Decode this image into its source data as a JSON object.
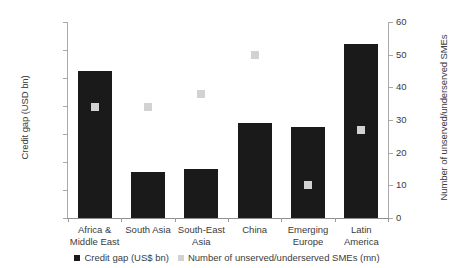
{
  "chart_data": {
    "type": "bar",
    "title": "",
    "xlabel": "",
    "ylabel": "Credit gap (USD bn)",
    "y2label": "Number of unserved/underserved SMEs",
    "categories": [
      "Africa &\nMiddle East",
      "South Asia",
      "South-East\nAsia",
      "China",
      "Emerging\nEurope",
      "Latin\nAmerica"
    ],
    "category_lines": [
      [
        "Africa &",
        "Middle East"
      ],
      [
        "South Asia",
        ""
      ],
      [
        "South-East",
        "Asia"
      ],
      [
        "China",
        ""
      ],
      [
        "Emerging",
        "Europe"
      ],
      [
        "Latin",
        "America"
      ]
    ],
    "series": [
      {
        "name": "Credit gap (US$ bn)",
        "type": "bar",
        "axis": "left",
        "color": "#1a1a1a",
        "values": [
          525,
          165,
          175,
          340,
          325,
          620
        ]
      },
      {
        "name": "Number of unserved/underserved SMEs (mn)",
        "type": "scatter",
        "axis": "right",
        "color": "#d2d2d2",
        "values": [
          34,
          34,
          38,
          50,
          10,
          27
        ]
      }
    ],
    "ylim": [
      0,
      700
    ],
    "yticks": [
      0,
      100,
      200,
      300,
      400,
      500,
      600,
      700
    ],
    "ytick_labels": [
      "$0",
      "$100",
      "$200",
      "$300",
      "$400",
      "$500",
      "$600",
      "$700"
    ],
    "y2lim": [
      0,
      60
    ],
    "y2ticks": [
      0,
      10,
      20,
      30,
      40,
      50,
      60
    ],
    "y2tick_labels": [
      "0",
      "10",
      "20",
      "30",
      "40",
      "50",
      "60"
    ],
    "grid": false,
    "legend_position": "bottom"
  },
  "legend": {
    "items": [
      {
        "label": "Credit gap (US$ bn)",
        "color": "#1a1a1a"
      },
      {
        "label": "Number of unserved/underserved SMEs (mn)",
        "color": "#d2d2d2"
      }
    ]
  }
}
